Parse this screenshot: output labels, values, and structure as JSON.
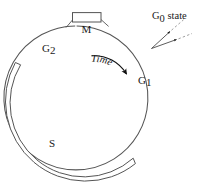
{
  "figure": {
    "background_color": "#ffffff",
    "line_color": "#555555",
    "text_color": "#1a1a1a",
    "width": 199,
    "height": 191
  },
  "cycle": {
    "center": {
      "x": 88,
      "y": 97
    },
    "radius": 72,
    "direction": "clockwise"
  },
  "phases": {
    "m": {
      "label": "M",
      "name": "mitosis-phase",
      "position": "top",
      "shape": "rectangle-box-on-circle"
    },
    "g1": {
      "label": "G",
      "subscript": "1",
      "name": "g1-phase",
      "position": "right"
    },
    "s": {
      "label": "S",
      "name": "s-phase",
      "position": "lower-left",
      "shape": "outer-crescent-band"
    },
    "g2": {
      "label": "G",
      "subscript": "2",
      "name": "g2-phase",
      "position": "upper-left"
    },
    "g0": {
      "label": "G",
      "subscript": "0",
      "suffix": " state",
      "full_label": "G0 state",
      "name": "g0-state",
      "position": "upper-right-outside",
      "arrow_count": 2,
      "arrow_style": "solid-head-with-dashed-tail"
    }
  },
  "time_arrow": {
    "label": "Time",
    "name": "time-arrow",
    "direction": "clockwise",
    "arrowhead": "solid-filled"
  }
}
